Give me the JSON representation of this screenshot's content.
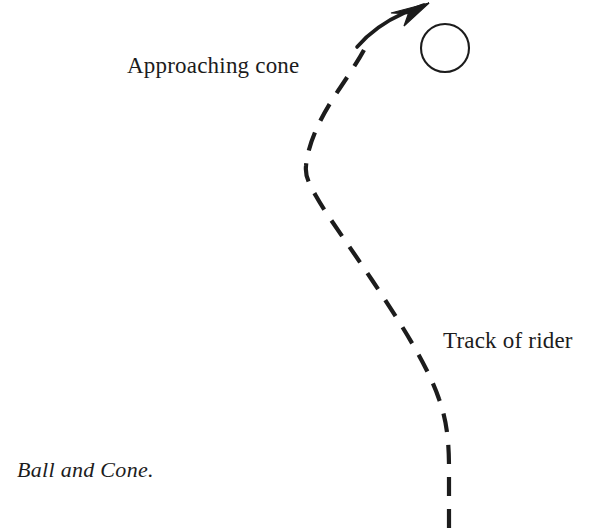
{
  "figure": {
    "caption": "Ball and Cone.",
    "background_color": "#ffffff",
    "ink_color": "#1c1c1c",
    "labels": {
      "approaching_cone": "Approaching cone",
      "track_of_rider": "Track of rider"
    },
    "elements": {
      "ball": {
        "name": "ball",
        "shape": "circle-outline",
        "center_x": 445,
        "center_y": 48,
        "radius": 24,
        "stroke_width": 2,
        "fill": "none",
        "stroke": "#1c1c1c"
      },
      "track": {
        "name": "track-of-rider",
        "style": "dashed",
        "stroke_width": 4.2,
        "dash_length": 19,
        "gap_length": 13,
        "stroke": "#1c1c1c",
        "path": "M 449 528 L 449 470 C 449 440 447 420 440 400 C 424 352 360 268 330 220 C 314 194 306 186 307 176 C 308 150 322 118 342 86 C 352 70 360 58 366 48"
      },
      "approach_arrow": {
        "name": "approach-arrow",
        "style": "solid",
        "stroke_width": 3.4,
        "stroke": "#1c1c1c",
        "path": "M 358 46 C 372 32 392 18 414 9",
        "arrow_tip_x": 428,
        "arrow_tip_y": 4
      }
    }
  }
}
